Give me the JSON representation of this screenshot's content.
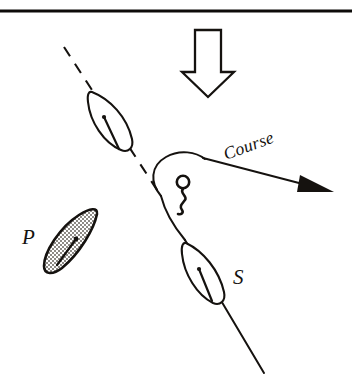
{
  "figure": {
    "background_color": "#ffffff",
    "ink_color": "#15120f",
    "shade_color": "#b9b6b1",
    "width": 352,
    "height": 384
  },
  "top_rule": {
    "name": "horizontal-rule",
    "y": 11,
    "x_start": 0,
    "x_end": 352
  },
  "wind_arrow": {
    "label": "wind-direction-arrow",
    "direction": "down",
    "x": 182,
    "y": 28,
    "width": 50,
    "height": 68,
    "fill": "#ffffff"
  },
  "course": {
    "label": "Course",
    "rotation_deg": -20,
    "arrowhead": "filled-triangle",
    "start": [
      180,
      160
    ],
    "end": [
      335,
      192
    ]
  },
  "mark": {
    "name": "racing-mark-buoy",
    "shape": "circle-with-wavy-tail",
    "cx": 183,
    "cy": 182,
    "r": 6
  },
  "boats": [
    {
      "id": "boat-upper",
      "label": "",
      "fill": "white",
      "cx": 110,
      "cy": 123,
      "angle_deg": 35,
      "length": 72,
      "beam": 26
    },
    {
      "id": "boat-p",
      "label": "P",
      "fill": "shaded",
      "cx": 70,
      "cy": 247,
      "angle_deg": 28,
      "length": 66,
      "beam": 25
    },
    {
      "id": "boat-s",
      "label": "S",
      "fill": "white",
      "cx": 209,
      "cy": 277,
      "angle_deg": 28,
      "length": 70,
      "beam": 26
    }
  ],
  "labels": {
    "port_boat": "P",
    "starboard_boat": "S",
    "course_label": "Course"
  },
  "lines": {
    "dashed_layline": {
      "name": "dashed-layline",
      "from": [
        65,
        48
      ],
      "to": [
        160,
        195
      ]
    },
    "solid_track": {
      "name": "solid-track-line",
      "from": [
        183,
        238
      ],
      "to": [
        263,
        372
      ]
    },
    "rounding_path": {
      "name": "mark-rounding-path",
      "description": "curved path from dashed layline around the mark to the course line"
    }
  }
}
